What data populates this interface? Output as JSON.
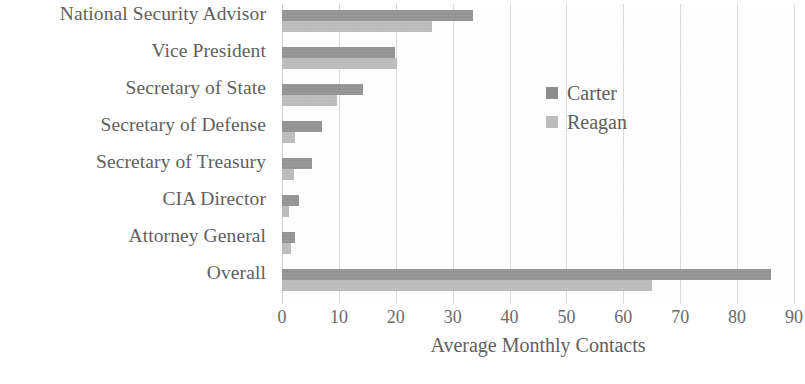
{
  "chart_data": {
    "type": "bar",
    "orientation": "horizontal",
    "title": "",
    "xlabel": "Average Monthly Contacts",
    "ylabel": "",
    "xlim": [
      0,
      90
    ],
    "xticks": [
      "0",
      "10",
      "20",
      "30",
      "40",
      "50",
      "60",
      "70",
      "80",
      "90"
    ],
    "grid": "vertical",
    "legend_position": "upper-right-inside",
    "categories": [
      "National Security Advisor",
      "Vice President",
      "Secretary of State",
      "Secretary of Defense",
      "Secretary of Treasury",
      "CIA Director",
      "Attorney General",
      "Overall"
    ],
    "series": [
      {
        "name": "Carter",
        "color": "#8c8c8c",
        "values": [
          33.5,
          19.8,
          14.2,
          7.1,
          5.2,
          3.0,
          2.2,
          86.0
        ]
      },
      {
        "name": "Reagan",
        "color": "#b8b8b8",
        "values": [
          26.4,
          20.2,
          9.6,
          2.3,
          2.1,
          1.3,
          1.5,
          65.0
        ]
      }
    ]
  }
}
